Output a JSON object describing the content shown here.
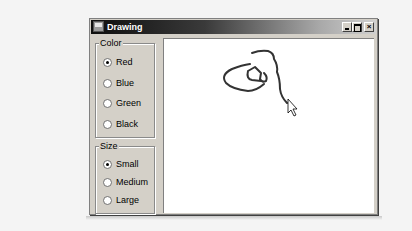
{
  "window": {
    "title": "Drawing",
    "controls": [
      "minimize",
      "maximize",
      "close"
    ]
  },
  "color_group": {
    "label": "Color",
    "options": [
      {
        "label": "Red",
        "checked": true
      },
      {
        "label": "Blue",
        "checked": false
      },
      {
        "label": "Green",
        "checked": false
      },
      {
        "label": "Black",
        "checked": false
      }
    ]
  },
  "size_group": {
    "label": "Size",
    "options": [
      {
        "label": "Small",
        "checked": true
      },
      {
        "label": "Medium",
        "checked": false
      },
      {
        "label": "Large",
        "checked": false
      }
    ]
  },
  "canvas": {
    "stroke_color": "#333333",
    "cursor": "arrow-pointer"
  }
}
